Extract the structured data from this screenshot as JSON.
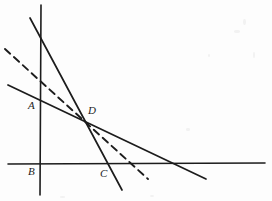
{
  "figure": {
    "kind": "line-diagram",
    "background_color": "#fdfdfd",
    "stroke_color": "#1c1c1c",
    "width": 272,
    "height": 201
  },
  "axes": {
    "vertical": {
      "name": "vertical-axis",
      "x1": 41,
      "y1": 5,
      "x2": 40,
      "y2": 195,
      "stroke_width": 1.6
    },
    "horizontal": {
      "name": "horizontal-axis",
      "x1": 8,
      "y1": 164,
      "x2": 265,
      "y2": 163,
      "stroke_width": 1.6
    }
  },
  "lines": [
    {
      "id": "steep-line",
      "style": "solid",
      "x1": 30,
      "y1": 18,
      "x2": 122,
      "y2": 190,
      "stroke_width": 1.7,
      "note": "steepest descending line, crosses vertical axis near top, passes through D, crosses horizontal axis at C"
    },
    {
      "id": "shallow-line",
      "style": "solid",
      "x1": 8,
      "y1": 85,
      "x2": 206,
      "y2": 179,
      "stroke_width": 1.7,
      "note": "shallow descending line, crosses vertical axis at A, passes through D"
    },
    {
      "id": "dashed-line",
      "style": "dashed",
      "x1": 5,
      "y1": 49,
      "x2": 148,
      "y2": 179,
      "stroke_width": 1.9,
      "dash_pattern": "7 5",
      "note": "dashed descending line of intermediate slope, passes through D"
    }
  ],
  "points": [
    {
      "id": "A",
      "label": "A",
      "label_x": 28,
      "label_y": 100,
      "anchor_x": 41,
      "anchor_y": 104
    },
    {
      "id": "B",
      "label": "B",
      "label_x": 28,
      "label_y": 166,
      "anchor_x": 41,
      "anchor_y": 164
    },
    {
      "id": "C",
      "label": "C",
      "label_x": 100,
      "label_y": 168,
      "anchor_x": 101,
      "anchor_y": 164
    },
    {
      "id": "D",
      "label": "D",
      "label_x": 88,
      "label_y": 105,
      "anchor_x": 87,
      "anchor_y": 120
    }
  ],
  "specks": [
    {
      "x": 243,
      "y": 19,
      "w": 3,
      "h": 6
    },
    {
      "x": 234,
      "y": 30,
      "w": 6,
      "h": 3
    },
    {
      "x": 253,
      "y": 52,
      "w": 2,
      "h": 6
    },
    {
      "x": 208,
      "y": 54,
      "w": 2,
      "h": 3
    },
    {
      "x": 186,
      "y": 128,
      "w": 4,
      "h": 3
    },
    {
      "x": 60,
      "y": 196,
      "w": 5,
      "h": 2
    },
    {
      "x": 150,
      "y": 195,
      "w": 4,
      "h": 2
    }
  ]
}
